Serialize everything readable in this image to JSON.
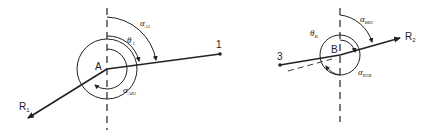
{
  "diagram": {
    "left": {
      "point_label": "A",
      "endpoint_label": "1",
      "vector_label": "R",
      "vector_sub": "1",
      "angle_labels": [
        {
          "sym": "α",
          "sub": "A1"
        },
        {
          "sym": "θ",
          "sub": "A"
        },
        {
          "sym": "α",
          "sub": "AR1"
        }
      ]
    },
    "right": {
      "point_label": "B",
      "endpoint_label": "3",
      "vector_label": "R",
      "vector_sub": "2",
      "angle_labels": [
        {
          "sym": "α",
          "sub": "BR2"
        },
        {
          "sym": "θ",
          "sub": "B"
        },
        {
          "sym": "α",
          "sub": "R2B"
        }
      ]
    },
    "colors": {
      "line": "#222222",
      "background": "#ffffff"
    }
  }
}
